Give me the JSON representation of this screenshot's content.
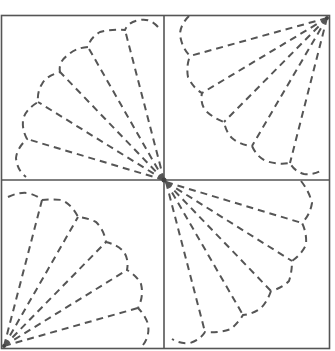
{
  "diagram": {
    "title": "",
    "type": "quilt-block-fan-pattern",
    "colors": {
      "background": "#ffffff",
      "frame": "#555555",
      "dash": "#555555"
    },
    "frame": {
      "x": 1,
      "y": 15,
      "width": 329,
      "height": 334
    },
    "center": {
      "x": 164,
      "y": 180
    },
    "quadrants": [
      {
        "name": "top-left",
        "apex": "bottom-right",
        "blades": 6
      },
      {
        "name": "top-right",
        "apex": "top-right",
        "blades": 5
      },
      {
        "name": "bottom-left",
        "apex": "bottom-left",
        "blades": 5
      },
      {
        "name": "bottom-right",
        "apex": "top-left",
        "blades": 6
      }
    ]
  }
}
